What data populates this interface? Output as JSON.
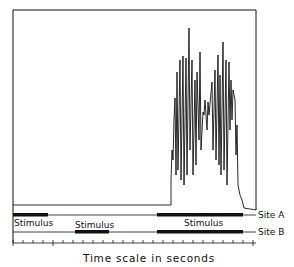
{
  "figure": {
    "colors": {
      "ink": "#111111",
      "background": "#ffffff"
    },
    "labels": {
      "site_a": "Site A",
      "site_b": "Site B",
      "stimulus_1": "Stimulus",
      "stimulus_2": "Stimulus",
      "stimulus_3": "Stimulus",
      "x_axis_title": "Time scale in seconds"
    },
    "tracks": [
      {
        "name": "Site A",
        "stimulus_segments_px": [
          [
            13,
            48
          ],
          [
            157,
            243
          ]
        ]
      },
      {
        "name": "Site B",
        "stimulus_segments_px": [
          [
            75,
            109
          ],
          [
            157,
            243
          ]
        ]
      }
    ],
    "axis": {
      "tick_count": 25,
      "unit": "seconds"
    },
    "trace": {
      "description": "flat baseline, abrupt rise then high-amplitude oscillations, decays at end"
    }
  }
}
